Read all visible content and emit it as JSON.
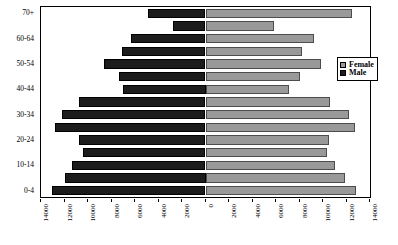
{
  "chart_data": {
    "type": "bar",
    "subtype": "population-pyramid",
    "title": "",
    "xlabel": "",
    "ylabel": "",
    "orientation": "horizontal",
    "grid": false,
    "legend_position": "right",
    "axis_center_value": 0,
    "xlim": [
      -14000,
      14000
    ],
    "x_tick_labels_left": [
      "14000",
      "12000",
      "10000",
      "8000",
      "6000",
      "4000",
      "2000",
      "0"
    ],
    "x_tick_labels_right": [
      "0",
      "2000",
      "4000",
      "6000",
      "8000",
      "10000",
      "12000",
      "14000"
    ],
    "x_tick_values": [
      14000,
      12000,
      10000,
      8000,
      6000,
      4000,
      2000,
      0,
      2000,
      4000,
      6000,
      8000,
      10000,
      12000,
      14000
    ],
    "categories": [
      "0-4",
      "5-9",
      "10-14",
      "15-19",
      "20-24",
      "25-29",
      "30-34",
      "35-39",
      "40-44",
      "45-49",
      "50-54",
      "55-59",
      "60-64",
      "65-69",
      "70+"
    ],
    "y_tick_labels_visible": [
      "0-4",
      "10-14",
      "20-24",
      "30-34",
      "40-44",
      "50-54",
      "60-64",
      "70+"
    ],
    "series": [
      {
        "name": "Male",
        "color": "#1c1c1c",
        "values": [
          13100,
          12000,
          11400,
          10400,
          10800,
          12800,
          12200,
          10800,
          7000,
          7400,
          8600,
          7100,
          6300,
          2800,
          4900
        ]
      },
      {
        "name": "Female",
        "color": "#999999",
        "values": [
          12800,
          11900,
          11000,
          10300,
          10500,
          12700,
          12200,
          10600,
          7100,
          8000,
          9800,
          8200,
          9200,
          5800,
          12500
        ]
      }
    ]
  },
  "legend": {
    "items": [
      {
        "label": "Female",
        "swatch": "female-swatch-icon"
      },
      {
        "label": "Male",
        "swatch": "male-swatch-icon"
      }
    ]
  }
}
